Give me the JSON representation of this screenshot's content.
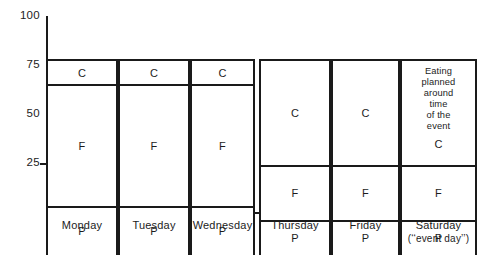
{
  "chart_data": {
    "type": "bar",
    "title": "",
    "subtitle": "",
    "xlabel": "",
    "ylabel": "",
    "ylim": [
      0,
      100
    ],
    "stacked": true,
    "percent": true,
    "grid": false,
    "legend_position": "none",
    "y_ticks": [
      100,
      75,
      50,
      25
    ],
    "y_tick_labels": [
      "100",
      "75",
      "50",
      "25"
    ],
    "categories": [
      "Monday",
      "Tuesday",
      "Wednesday",
      "Thursday",
      "Friday",
      "Saturday"
    ],
    "category_sublabels": [
      "",
      "",
      "",
      "",
      "",
      "(‘‘event day’’)"
    ],
    "group_break_after_index": 2,
    "series": [
      {
        "name": "P",
        "label": "P",
        "values": [
          25,
          25,
          25,
          18,
          18,
          18
        ]
      },
      {
        "name": "F",
        "label": "F",
        "values": [
          62,
          62,
          62,
          28,
          28,
          28
        ]
      },
      {
        "name": "C",
        "label": "C",
        "values": [
          13,
          13,
          13,
          54,
          54,
          54
        ]
      }
    ],
    "annotations": [
      {
        "target_category": "Saturday",
        "target_series": "C",
        "text": "Eating planned around time of the event",
        "lines": [
          "Eating",
          "planned",
          "around",
          "time",
          "of the",
          "event"
        ]
      }
    ],
    "colors": {
      "line": "#1a1a1a",
      "fill": "#ffffff",
      "text": "#1c1c1c"
    }
  },
  "bars": [
    {
      "category": "Monday",
      "sublabel": "",
      "segments": [
        {
          "label": "C",
          "note_lines": [],
          "from": 87,
          "to": 100
        },
        {
          "label": "F",
          "note_lines": [],
          "from": 25,
          "to": 87
        },
        {
          "label": "P",
          "note_lines": [],
          "from": 0,
          "to": 25
        }
      ]
    },
    {
      "category": "Tuesday",
      "sublabel": "",
      "segments": [
        {
          "label": "C",
          "note_lines": [],
          "from": 87,
          "to": 100
        },
        {
          "label": "F",
          "note_lines": [],
          "from": 25,
          "to": 87
        },
        {
          "label": "P",
          "note_lines": [],
          "from": 0,
          "to": 25
        }
      ]
    },
    {
      "category": "Wednesday",
      "sublabel": "",
      "segments": [
        {
          "label": "C",
          "note_lines": [],
          "from": 87,
          "to": 100
        },
        {
          "label": "F",
          "note_lines": [],
          "from": 25,
          "to": 87
        },
        {
          "label": "P",
          "note_lines": [],
          "from": 0,
          "to": 25
        }
      ]
    },
    {
      "category": "Thursday",
      "sublabel": "",
      "segments": [
        {
          "label": "C",
          "note_lines": [],
          "from": 46,
          "to": 100
        },
        {
          "label": "F",
          "note_lines": [],
          "from": 18,
          "to": 46
        },
        {
          "label": "P",
          "note_lines": [],
          "from": 0,
          "to": 18
        }
      ]
    },
    {
      "category": "Friday",
      "sublabel": "",
      "segments": [
        {
          "label": "C",
          "note_lines": [],
          "from": 46,
          "to": 100
        },
        {
          "label": "F",
          "note_lines": [],
          "from": 18,
          "to": 46
        },
        {
          "label": "P",
          "note_lines": [],
          "from": 0,
          "to": 18
        }
      ]
    },
    {
      "category": "Saturday",
      "sublabel": "(‘‘event day’’)",
      "segments": [
        {
          "label": "C",
          "note_lines": [
            "Eating",
            "planned",
            "around",
            "time",
            "of the",
            "event"
          ],
          "from": 46,
          "to": 100
        },
        {
          "label": "F",
          "note_lines": [],
          "from": 18,
          "to": 46
        },
        {
          "label": "P",
          "note_lines": [],
          "from": 0,
          "to": 18
        }
      ]
    }
  ]
}
